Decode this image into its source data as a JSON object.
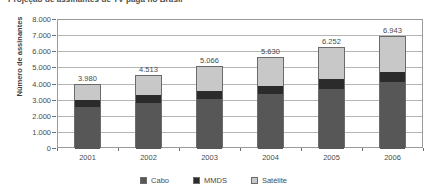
{
  "chart_data": {
    "type": "bar",
    "stacked": true,
    "title": "Projeção de assinantes de TV paga no Brasil",
    "xlabel": "",
    "ylabel": "Número de assinantes",
    "categories": [
      "2001",
      "2002",
      "2003",
      "2004",
      "2005",
      "2006"
    ],
    "series": [
      {
        "name": "Cabo",
        "color": "#575757",
        "values": [
          2600,
          2850,
          3100,
          3380,
          3750,
          4180
        ]
      },
      {
        "name": "MMDS",
        "color": "#2b2b2b",
        "values": [
          430,
          470,
          500,
          540,
          580,
          620
        ]
      },
      {
        "name": "Satélite",
        "color": "#c8c8c8",
        "values": [
          950,
          1193,
          1466,
          1710,
          1922,
          2143
        ]
      }
    ],
    "totals": [
      3980,
      4513,
      5066,
      5630,
      6252,
      6943
    ],
    "total_labels": [
      "3.980",
      "4.513",
      "5.066",
      "5.630",
      "6.252",
      "6.943"
    ],
    "ylim": [
      0,
      8000
    ],
    "ytick_values": [
      0,
      1000,
      2000,
      3000,
      4000,
      5000,
      6000,
      7000,
      8000
    ],
    "ytick_labels": [
      "0",
      "1.000",
      "2.000",
      "3.000",
      "4.000",
      "5.000",
      "6.000",
      "7.000",
      "8.000"
    ],
    "grid": true,
    "legend_position": "bottom"
  },
  "legend": {
    "items": [
      {
        "label": "Cabo"
      },
      {
        "label": "MMDS"
      },
      {
        "label": "Satélite"
      }
    ]
  }
}
